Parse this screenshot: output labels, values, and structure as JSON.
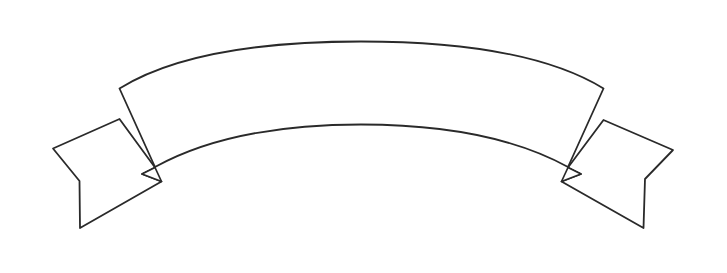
{
  "document": {
    "title": "Banner Ribbon Outline",
    "kind": "line-art-illustration",
    "subject": "arched scroll banner with two swallowtail ribbon ends",
    "style": "black outline drawing, unfilled"
  },
  "canvas": {
    "width": 727,
    "height": 273,
    "background_color": "#ffffff"
  },
  "ink": {
    "stroke_color": "#2a2a2a",
    "fill_color": "#ffffff",
    "stroke_width": 1.8
  },
  "banner": {
    "label": "",
    "placeholder": "",
    "center_band": {
      "name": "main-arched-band",
      "left_top": [
        119,
        88
      ],
      "right_top": [
        604,
        88
      ],
      "left_bottom": [
        155,
        167
      ],
      "right_bottom": [
        568,
        167
      ],
      "outer_arc_peak": [
        361,
        42
      ],
      "inner_arc_peak": [
        361,
        125
      ]
    },
    "left_tail": {
      "name": "left-swallowtail",
      "attach_top": [
        119,
        119
      ],
      "outer_vertex": [
        53,
        148
      ],
      "notch_vertex": [
        79,
        181
      ],
      "bottom_tip": [
        80,
        228
      ],
      "inner_join": [
        160,
        181
      ]
    },
    "right_tail": {
      "name": "right-swallowtail",
      "attach_top": [
        604,
        120
      ],
      "outer_vertex": [
        673,
        150
      ],
      "notch_vertex": [
        645,
        179
      ],
      "bottom_tip": [
        643,
        228
      ],
      "inner_join": [
        563,
        181
      ]
    },
    "left_fold": {
      "name": "left-fold-notch",
      "points": [
        [
          155,
          167
        ],
        [
          162,
          182
        ],
        [
          142,
          174
        ]
      ]
    },
    "right_fold": {
      "name": "right-fold-notch",
      "points": [
        [
          568,
          167
        ],
        [
          561,
          182
        ],
        [
          581,
          174
        ]
      ]
    }
  },
  "paths": {
    "main_band": "M 119.5 88.5 C 175 54 262 41.5 361 41.5 C 460 41.5 548 54.5 603.5 88.5 L 568 167 C 516 138.5 444 124.5 361 124.5 C 278 124.5 206.5 138.5 155 167 Z",
    "left_tail": "M 119.5 119 L 53 148.5 L 79.5 181 L 80 228 L 161.5 181.5 L 142 174 L 155 167.5 Z",
    "right_tail": "M 603.5 120 L 673 150 L 645 179 L 643.5 228 L 561.5 181.5 L 581 174 L 568 167.5 Z",
    "left_fold": "M 155 167.5 L 161.5 181.5 L 142 174 Z",
    "right_fold": "M 568 167.5 L 561.5 181.5 L 581 174 Z"
  }
}
